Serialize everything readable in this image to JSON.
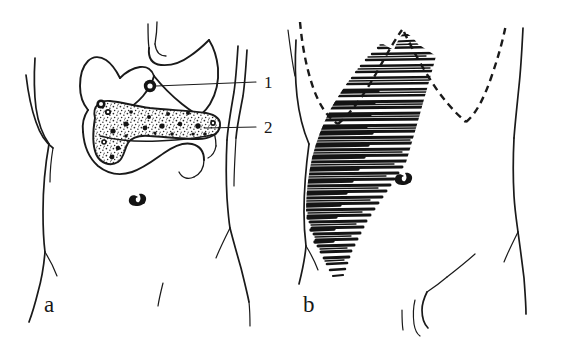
{
  "figure": {
    "kind": "anatomical-line-drawing",
    "background_color": "#ffffff",
    "ink_color": "#1a1a1a",
    "panel_count": 2
  },
  "panels": [
    {
      "letter": "a",
      "name": "organ-overlay-panel",
      "description": "Front view line drawing of human torso with stomach, duodenum, liver and pancreas drawn over the abdomen; two numbered leader lines point to structures.",
      "letter_position": {
        "x": 44,
        "y": 312
      },
      "callouts": [
        {
          "number": "1",
          "label_position": {
            "x": 264,
            "y": 88
          },
          "leader_from": {
            "x": 156,
            "y": 86
          },
          "leader_to": {
            "x": 256,
            "y": 83
          },
          "points_to": "duct-orifice-ring"
        },
        {
          "number": "2",
          "label_position": {
            "x": 264,
            "y": 133
          },
          "leader_from": {
            "x": 205,
            "y": 128
          },
          "leader_to": {
            "x": 256,
            "y": 128
          },
          "points_to": "pancreas"
        }
      ],
      "organs": [
        "stomach",
        "esophagus",
        "duodenum",
        "liver-margin",
        "pancreas-stippled",
        "umbilicus"
      ]
    },
    {
      "letter": "b",
      "name": "pain-radiation-panel",
      "description": "Same torso outline with dashed costal margin and a dense horizontally-hatched band sweeping from the left hypochondrium down across the abdomen, indicating the region of referred pain.",
      "letter_position": {
        "x": 303,
        "y": 312
      },
      "shading": {
        "style": "horizontal-hatching",
        "region": "left-upper-quadrant-to-lower-abdomen",
        "stroke_color": "#141414"
      },
      "features": [
        "dashed-costal-margin",
        "body-outline",
        "umbilicus",
        "inguinal-fold"
      ]
    }
  ],
  "legend": {
    "items": [
      {
        "key": "1",
        "text": "1"
      },
      {
        "key": "2",
        "text": "2"
      }
    ]
  }
}
